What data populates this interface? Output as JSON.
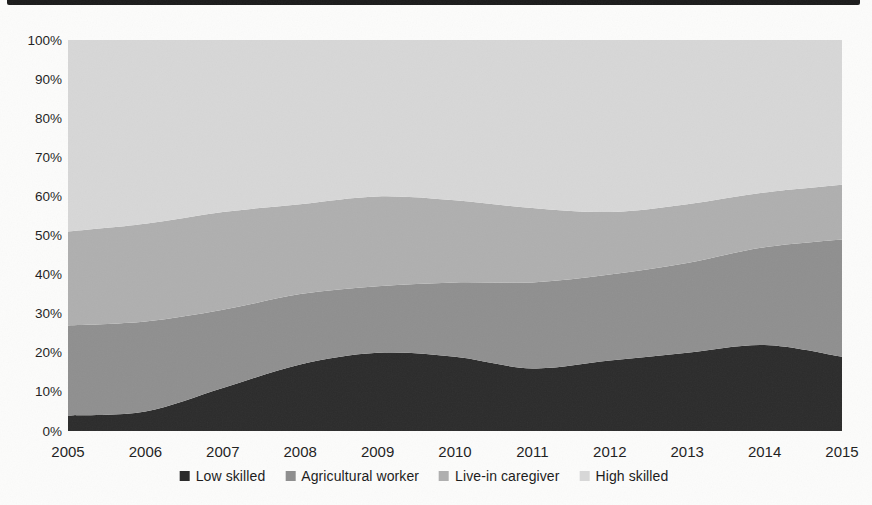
{
  "page": {
    "background_color": "#fcfcfb",
    "text_color": "#1d1d1d"
  },
  "scan_artifacts": {
    "top_edge_bar_color": "#1a1a1a"
  },
  "chart_data": {
    "type": "area",
    "stacked": true,
    "percent_stacked": true,
    "x": [
      2005,
      2006,
      2007,
      2008,
      2009,
      2010,
      2011,
      2012,
      2013,
      2014,
      2015
    ],
    "x_tick_labels": [
      "2005",
      "2006",
      "2007",
      "2008",
      "2009",
      "2010",
      "2011",
      "2012",
      "2013",
      "2014",
      "2015"
    ],
    "y_tick_labels": [
      "0%",
      "10%",
      "20%",
      "30%",
      "40%",
      "50%",
      "60%",
      "70%",
      "80%",
      "90%",
      "100%"
    ],
    "ylim": [
      0,
      100
    ],
    "ytick_step": 10,
    "grid": false,
    "legend_position": "bottom",
    "series": [
      {
        "name": "Low skilled",
        "color": "#2b2b2b",
        "values": [
          4,
          5,
          11,
          17,
          20,
          19,
          16,
          18,
          20,
          22,
          19
        ]
      },
      {
        "name": "Agricultural worker",
        "color": "#8f8f8f",
        "values": [
          23,
          23,
          20,
          18,
          17,
          19,
          22,
          22,
          23,
          25,
          30
        ]
      },
      {
        "name": "Live-in caregiver",
        "color": "#afafaf",
        "values": [
          24,
          25,
          25,
          23,
          23,
          21,
          19,
          16,
          15,
          14,
          14
        ]
      },
      {
        "name": "High skilled",
        "color": "#d7d7d7",
        "values": [
          49,
          47,
          44,
          42,
          40,
          41,
          43,
          44,
          42,
          39,
          37
        ]
      }
    ],
    "cumulative_top_boundaries_percent": {
      "low_skilled": [
        4,
        5,
        11,
        17,
        20,
        19,
        16,
        18,
        20,
        22,
        19
      ],
      "agricultural_worker": [
        27,
        28,
        31,
        35,
        37,
        38,
        38,
        40,
        43,
        47,
        49
      ],
      "live_in_caregiver": [
        51,
        53,
        56,
        58,
        60,
        59,
        57,
        56,
        58,
        61,
        63
      ],
      "high_skilled": [
        100,
        100,
        100,
        100,
        100,
        100,
        100,
        100,
        100,
        100,
        100
      ]
    }
  },
  "plot_area": {
    "left": 68,
    "top": 40,
    "right": 842,
    "bottom": 431
  }
}
